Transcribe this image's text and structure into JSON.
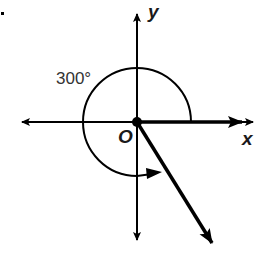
{
  "diagram": {
    "angle_label": "300°",
    "angle_degrees": 300,
    "y_axis_label": "y",
    "x_axis_label": "x",
    "origin_label": "O",
    "colors": {
      "stroke": "#000000",
      "text": "#1a1a1a"
    }
  }
}
